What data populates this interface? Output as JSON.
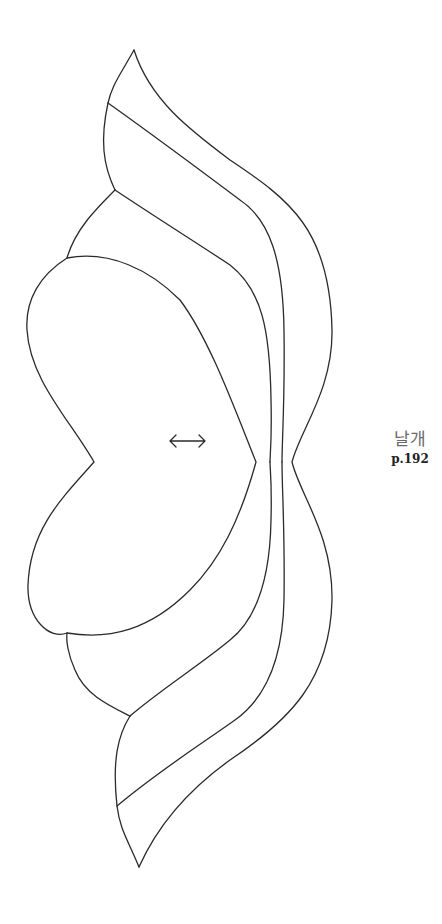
{
  "pattern": {
    "title": "날개",
    "page_ref": "p.192",
    "grain_arrow_icon": "double-arrow-horizontal",
    "line_color": "#2b2b2b",
    "background": "#ffffff"
  }
}
